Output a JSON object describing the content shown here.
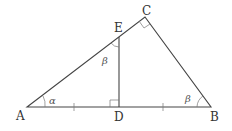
{
  "diagram": {
    "points": {
      "A": {
        "label": "A",
        "x": 27,
        "y": 107
      },
      "D": {
        "label": "D",
        "x": 119,
        "y": 107
      },
      "B": {
        "label": "B",
        "x": 211,
        "y": 107
      },
      "C": {
        "label": "C",
        "x": 145,
        "y": 17
      },
      "E": {
        "label": "E",
        "x": 119,
        "y": 37
      }
    },
    "angles": {
      "alpha": {
        "label": "α",
        "at": "A"
      },
      "beta_E": {
        "label": "β",
        "at": "E"
      },
      "beta_B": {
        "label": "β",
        "at": "B"
      }
    },
    "right_angles": [
      "C",
      "D"
    ],
    "tick_marks": [
      "AD",
      "DB"
    ],
    "colors": {
      "line": "#444444",
      "text": "#333333"
    }
  }
}
